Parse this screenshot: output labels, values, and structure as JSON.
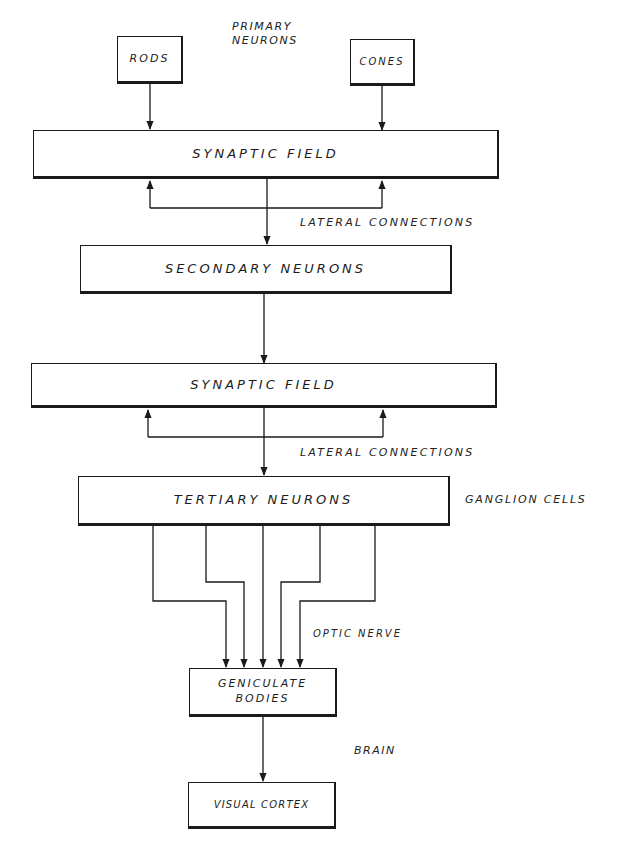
{
  "diagram": {
    "title_label": {
      "line1": "PRIMARY",
      "line2": "NEURONS"
    },
    "nodes": {
      "rods": "RODS",
      "cones": "CONES",
      "synaptic_field_1": "SYNAPTIC FIELD",
      "secondary_neurons": "SECONDARY NEURONS",
      "synaptic_field_2": "SYNAPTIC FIELD",
      "tertiary_neurons": "TERTIARY NEURONS",
      "geniculate_line1": "GENICULATE",
      "geniculate_line2": "BODIES",
      "visual_cortex": "VISUAL CORTEX"
    },
    "annotations": {
      "lateral_connections_1": "LATERAL CONNECTIONS",
      "lateral_connections_2": "LATERAL CONNECTIONS",
      "ganglion_cells": "GANGLION CELLS",
      "optic_nerve": "OPTIC NERVE",
      "brain": "BRAIN"
    },
    "edges": [
      {
        "from": "rods",
        "to": "synaptic_field_1"
      },
      {
        "from": "cones",
        "to": "synaptic_field_1"
      },
      {
        "from": "synaptic_field_1",
        "to": "secondary_neurons"
      },
      {
        "from": "synaptic_field_1",
        "to": "synaptic_field_1",
        "label": "lateral connections (loop)"
      },
      {
        "from": "secondary_neurons",
        "to": "synaptic_field_2"
      },
      {
        "from": "synaptic_field_2",
        "to": "tertiary_neurons"
      },
      {
        "from": "synaptic_field_2",
        "to": "synaptic_field_2",
        "label": "lateral connections (loop)"
      },
      {
        "from": "tertiary_neurons",
        "to": "geniculate_bodies",
        "count": 5,
        "label": "optic nerve"
      },
      {
        "from": "geniculate_bodies",
        "to": "visual_cortex"
      }
    ],
    "colors": {
      "ink": "#1a1a1a",
      "paper": "#ffffff"
    }
  }
}
